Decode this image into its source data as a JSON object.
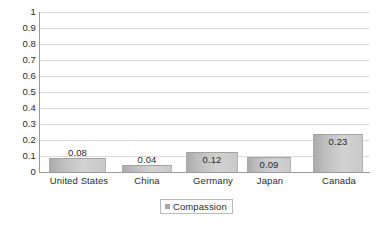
{
  "chart_data": {
    "type": "bar",
    "title": "",
    "subtitle": "",
    "xlabel": "",
    "ylabel": "",
    "categories": [
      "United States",
      "China",
      "Germany",
      "Japan",
      "Canada"
    ],
    "series": [
      {
        "name": "Compassion",
        "values": [
          0.08,
          0.04,
          0.12,
          0.09,
          0.23
        ],
        "value_labels": [
          "0.08",
          "0.04",
          "0.12",
          "0.09",
          "0.23"
        ]
      }
    ],
    "ylim": [
      0,
      1
    ],
    "ytick_step": 0.1,
    "ytick_labels": [
      "1",
      "0.9",
      "0.8",
      "0.7",
      "0.6",
      "0.5",
      "0.4",
      "0.3",
      "0.2",
      "0.1",
      "0"
    ],
    "ytick_values": [
      1,
      0.9,
      0.8,
      0.7,
      0.6,
      0.5,
      0.4,
      0.3,
      0.2,
      0.1,
      0
    ],
    "grid": {
      "horizontal": true,
      "vertical": false,
      "color": "#dcdcdc"
    },
    "legend": {
      "position": "bottom-center",
      "entries": [
        {
          "label": "Compassion",
          "swatch_color": "#a8a8a8"
        }
      ],
      "border_color": "#b9b9b9"
    },
    "colors": {
      "bar_gradient_start": "#a9a9a9",
      "bar_gradient_end": "#d2d2d2",
      "bar_border": "#a3a3a3",
      "axis_line": "#9a9a9a",
      "text": "#2b2b2b",
      "background": "#ffffff"
    },
    "bar_geometry": [
      {
        "left": 9,
        "width": 57
      },
      {
        "left": 82,
        "width": 50
      },
      {
        "left": 146,
        "width": 52
      },
      {
        "left": 207,
        "width": 44
      },
      {
        "left": 273,
        "width": 50
      }
    ],
    "category_label_geometry": [
      {
        "left": -3,
        "width": 84
      },
      {
        "left": 76,
        "width": 62
      },
      {
        "left": 136,
        "width": 74
      },
      {
        "left": 202,
        "width": 56
      },
      {
        "left": 268,
        "width": 62
      }
    ]
  }
}
